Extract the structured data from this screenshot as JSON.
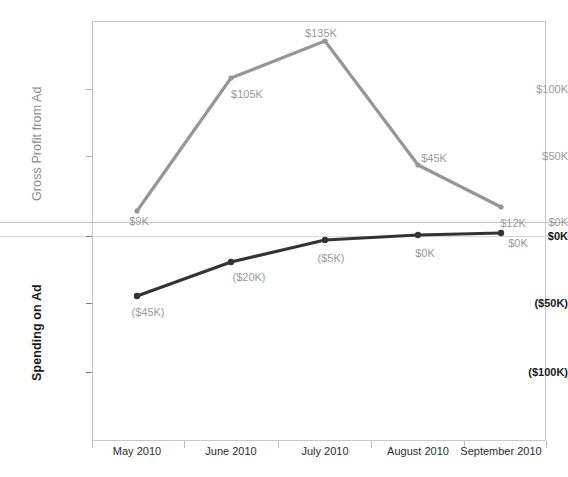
{
  "chart_data": {
    "type": "line",
    "title": "",
    "xlabel": "",
    "grid": false,
    "legend": "none",
    "dual_axis": true,
    "categories": [
      "May 2010",
      "June 2010",
      "July 2010",
      "August 2010",
      "September 2010"
    ],
    "series": [
      {
        "name": "Gross Profit from Ad",
        "axis": "left-upper",
        "color": "#969696",
        "values": [
          9,
          105,
          135,
          45,
          12
        ],
        "point_labels": [
          "$9K",
          "$105K",
          "$135K",
          "$45K",
          "$12K"
        ],
        "ylabel": "Gross Profit from Ad",
        "ytick_labels": [
          "$0K",
          "$50K",
          "$100K"
        ],
        "ytick_values": [
          0,
          50,
          100
        ],
        "ylim": [
          0,
          150
        ]
      },
      {
        "name": "Spending on Ad",
        "axis": "left-lower",
        "color": "#333333",
        "values": [
          -45,
          -20,
          -5,
          0,
          0
        ],
        "point_labels": [
          "($45K)",
          "($20K)",
          "($5K)",
          "$0K",
          "$0K"
        ],
        "ylabel": "Spending on Ad",
        "ytick_labels": [
          "$0K",
          "($50K)",
          "($100K)"
        ],
        "ytick_values": [
          0,
          -50,
          -100
        ],
        "ylim": [
          -150,
          0
        ]
      }
    ]
  },
  "axes": {
    "profit": {
      "title": "Gross Profit from Ad",
      "ticks": [
        {
          "label": "$100K",
          "y": 89
        },
        {
          "label": "$50K",
          "y": 156
        },
        {
          "label": "$0K",
          "y": 222
        }
      ]
    },
    "spend": {
      "title": "Spending on Ad",
      "ticks": [
        {
          "label": "$0K",
          "y": 236
        },
        {
          "label": "($50K)",
          "y": 303
        },
        {
          "label": "($100K)",
          "y": 372
        }
      ]
    }
  },
  "xaxis": {
    "ticks": [
      {
        "label": "May 2010",
        "x": 137
      },
      {
        "label": "June 2010",
        "x": 231
      },
      {
        "label": "July 2010",
        "x": 325
      },
      {
        "label": "August 2010",
        "x": 418
      },
      {
        "label": "September 2010",
        "x": 501
      }
    ]
  },
  "profit_points": [
    {
      "label": "$9K",
      "x": 137,
      "y": 211,
      "lx": 139,
      "ly": 216
    },
    {
      "label": "$105K",
      "x": 231,
      "y": 78,
      "lx": 247,
      "ly": 89
    },
    {
      "label": "$135K",
      "x": 325,
      "y": 41,
      "lx": 321,
      "ly": 28
    },
    {
      "label": "$45K",
      "x": 418,
      "y": 165,
      "lx": 434,
      "ly": 153
    },
    {
      "label": "$12K",
      "x": 501,
      "y": 207,
      "lx": 513,
      "ly": 218
    }
  ],
  "spend_points": [
    {
      "label": "($45K)",
      "x": 137,
      "y": 296,
      "lx": 148,
      "ly": 307
    },
    {
      "label": "($20K)",
      "x": 231,
      "y": 262,
      "lx": 249,
      "ly": 272
    },
    {
      "label": "($5K)",
      "x": 325,
      "y": 240,
      "lx": 331,
      "ly": 253
    },
    {
      "label": "$0K",
      "x": 418,
      "y": 235,
      "lx": 425,
      "ly": 248
    },
    {
      "label": "$0K",
      "x": 501,
      "y": 233,
      "lx": 518,
      "ly": 238
    }
  ]
}
